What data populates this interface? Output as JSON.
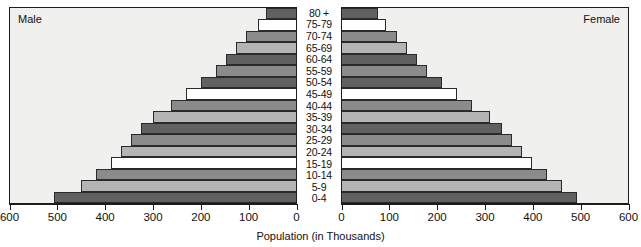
{
  "labels": {
    "male": "Male",
    "female": "Female",
    "axis_title": "Population (in Thousands)"
  },
  "colors": {
    "white": "#ffffff",
    "light_gray": "#b4b4b4",
    "medium_gray": "#8b8b8b",
    "dark_gray": "#616161",
    "panel_background": "#f0f0ee",
    "outline": "#1c1c1c"
  },
  "axis": {
    "left_ticks": [
      "600",
      "500",
      "400",
      "300",
      "200",
      "100",
      "0"
    ],
    "right_ticks": [
      "0",
      "100",
      "200",
      "300",
      "400",
      "500",
      "600"
    ],
    "max": 600,
    "tick_step": 100
  },
  "chart_data": {
    "type": "bar",
    "subtype": "population-pyramid",
    "title": "",
    "xlabel": "Population (in Thousands)",
    "ylabel": "",
    "xlim": [
      0,
      600
    ],
    "grid": false,
    "legend": [
      "Male",
      "Female"
    ],
    "legend_position": "inside-top-corners",
    "categories": [
      "80 +",
      "75-79",
      "70-74",
      "65-69",
      "60-64",
      "55-59",
      "50-54",
      "45-49",
      "40-44",
      "35-39",
      "30-34",
      "25-29",
      "20-24",
      "15-19",
      "10-14",
      "5-9",
      "0-4"
    ],
    "series": [
      {
        "name": "Male",
        "side": "left",
        "values": [
          63,
          80,
          105,
          126,
          147,
          168,
          200,
          230,
          262,
          300,
          326,
          347,
          368,
          389,
          420,
          452,
          508
        ]
      },
      {
        "name": "Female",
        "side": "right",
        "values": [
          75,
          92,
          115,
          136,
          157,
          178,
          210,
          242,
          273,
          310,
          336,
          357,
          378,
          399,
          430,
          462,
          494
        ]
      }
    ],
    "bar_fills": [
      "dark_gray",
      "white",
      "medium_gray",
      "light_gray",
      "dark_gray",
      "medium_gray",
      "dark_gray",
      "white",
      "medium_gray",
      "light_gray",
      "dark_gray",
      "medium_gray",
      "light_gray",
      "white",
      "medium_gray",
      "light_gray",
      "dark_gray"
    ]
  }
}
